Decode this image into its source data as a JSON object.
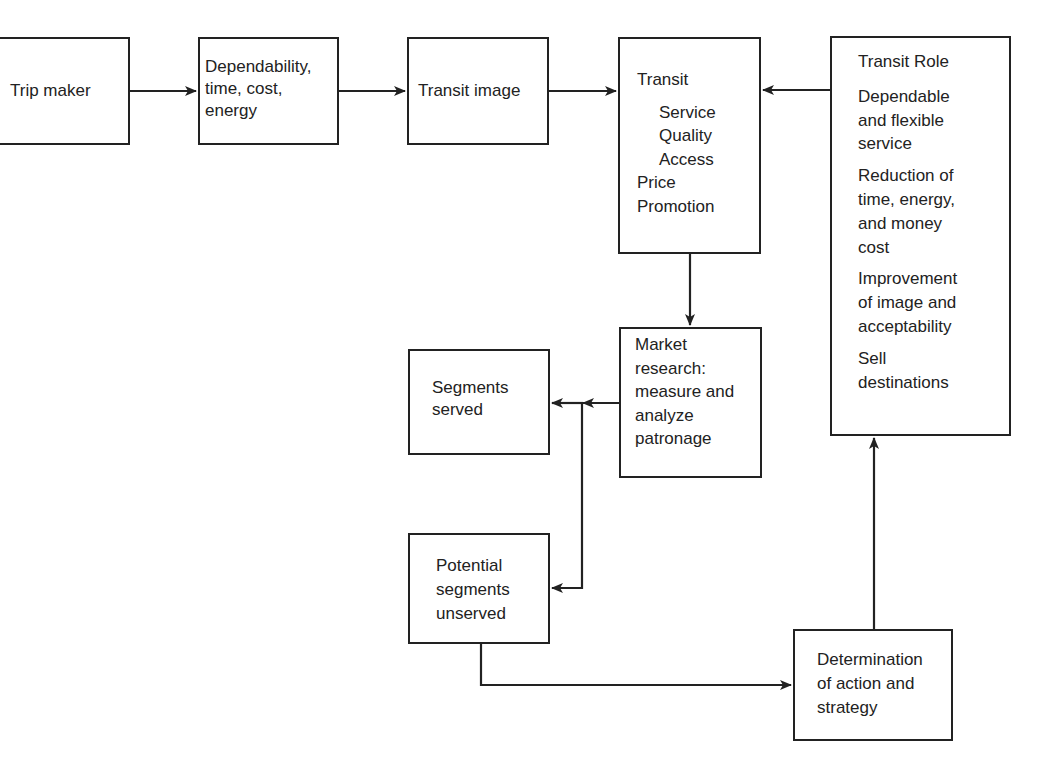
{
  "boxes": {
    "trip_maker": {
      "lines": [
        "Trip maker"
      ]
    },
    "dependability": {
      "lines": [
        "Dependability,",
        "time, cost,",
        "energy"
      ]
    },
    "transit_image": {
      "lines": [
        "Transit image"
      ]
    },
    "transit": {
      "title": "Transit",
      "sub": [
        "Service",
        "Quality",
        "Access"
      ],
      "more": [
        "Price",
        "Promotion"
      ]
    },
    "transit_role": {
      "title": "Transit Role",
      "items": [
        [
          "Dependable",
          "and flexible",
          "service"
        ],
        [
          "Reduction of",
          "time, energy,",
          "and money",
          "cost"
        ],
        [
          "Improvement",
          "of image and",
          "acceptability"
        ],
        [
          "Sell",
          "destinations"
        ]
      ]
    },
    "market_research": {
      "lines": [
        "Market",
        "research:",
        "measure and",
        "analyze",
        "patronage"
      ]
    },
    "segments_served": {
      "lines": [
        "Segments",
        "served"
      ]
    },
    "potential_segments": {
      "lines": [
        "Potential",
        "segments",
        "unserved"
      ]
    },
    "determination": {
      "lines": [
        "Determination",
        "of action and",
        "strategy"
      ]
    }
  }
}
